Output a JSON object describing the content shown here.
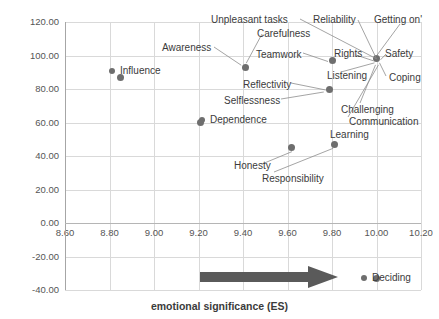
{
  "chart_data": {
    "type": "scatter",
    "title": "",
    "xlabel": "emotional significance (ES)",
    "ylabel": "importance (sp)",
    "xlim": [
      8.6,
      10.2
    ],
    "ylim": [
      -40,
      120
    ],
    "xticks": [
      "8.60",
      "8.80",
      "9.00",
      "9.20",
      "9.40",
      "9.60",
      "9.80",
      "10.00",
      "10.20"
    ],
    "xtick_values": [
      8.6,
      8.8,
      9.0,
      9.2,
      9.4,
      9.6,
      9.8,
      10.0,
      10.2
    ],
    "yticks": [
      "120.00",
      "100.00",
      "80.00",
      "60.00",
      "40.00",
      "20.00",
      "0.00",
      "-20.00",
      "-40.00"
    ],
    "ytick_values": [
      120,
      100,
      80,
      60,
      40,
      20,
      0,
      -20,
      -40
    ],
    "grid": true,
    "legend": "none",
    "marker_color": "#6e6e6e",
    "points": [
      {
        "label": "Influence",
        "x": 8.85,
        "y": 87
      },
      {
        "label": "Awareness",
        "x": 9.41,
        "y": 93
      },
      {
        "label": "Carefulness",
        "x": 9.41,
        "y": 93
      },
      {
        "label": "Dependence",
        "x": 9.21,
        "y": 60
      },
      {
        "label": "Teamwork",
        "x": 9.8,
        "y": 97
      },
      {
        "label": "Reflectivity",
        "x": 9.79,
        "y": 80
      },
      {
        "label": "Unpleasant tasks",
        "x": 10.0,
        "y": 98
      },
      {
        "label": "Reliability",
        "x": 10.0,
        "y": 98
      },
      {
        "label": "Getting on'",
        "x": 10.0,
        "y": 98
      },
      {
        "label": "Rights",
        "x": 10.0,
        "y": 98
      },
      {
        "label": "Safety",
        "x": 10.0,
        "y": 98
      },
      {
        "label": "Listening",
        "x": 10.0,
        "y": 98
      },
      {
        "label": "Coping",
        "x": 10.0,
        "y": 98
      },
      {
        "label": "Challenging",
        "x": 10.0,
        "y": 98
      },
      {
        "label": "Communication",
        "x": 10.0,
        "y": 98
      },
      {
        "label": "Selflessness",
        "x": 9.79,
        "y": 80
      },
      {
        "label": "Honesty",
        "x": 9.62,
        "y": 45
      },
      {
        "label": "Responsibility",
        "x": 9.81,
        "y": 47
      },
      {
        "label": "Learning",
        "x": 9.81,
        "y": 47
      },
      {
        "label": "Deciding",
        "x": 10.0,
        "y": -33
      }
    ],
    "annotations": [
      {
        "name": "trend-arrow",
        "description": "horizontal right-pointing arrow",
        "x_start": 9.25,
        "x_end": 9.8,
        "y": -30,
        "color": "#5a5a5a"
      }
    ]
  },
  "labels": {
    "unpleasant_tasks": "Unpleasant tasks",
    "reliability": "Reliability",
    "getting_on": "Getting on'",
    "carefulness": "Carefulness",
    "awareness": "Awareness",
    "teamwork": "Teamwork",
    "rights": "Rights",
    "safety": "Safety",
    "influence": "Influence",
    "reflectivity": "Reflectivity",
    "listening": "Listening",
    "coping": "Coping",
    "selflessness": "Selflessness",
    "dependence": "Dependence",
    "challenging": "Challenging",
    "communication": "Communication",
    "learning": "Learning",
    "honesty": "Honesty",
    "responsibility": "Responsibility",
    "deciding": "Deciding"
  }
}
